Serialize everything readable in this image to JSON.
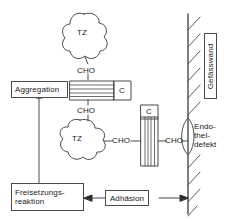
{
  "diagram": {
    "language": "de",
    "stroke_color": "#4a4a4a",
    "background": "#ffffff"
  },
  "nodes": {
    "platelet_top": {
      "label": "TZ",
      "shape": "blob",
      "x": 84,
      "y": 36
    },
    "platelet_bottom": {
      "label": "TZ",
      "shape": "blob",
      "x": 78,
      "y": 139
    },
    "cho_top": {
      "label": "CHO"
    },
    "cho_mid": {
      "label": "CHO"
    },
    "cho_left": {
      "label": "CHO"
    },
    "cho_right": {
      "label": "CHO"
    },
    "collagen_horizontal": {
      "label": "C",
      "shape": "hatched-rect-horizontal"
    },
    "collagen_vertical": {
      "label": "C",
      "shape": "hatched-rect-vertical"
    },
    "vessel_wall": {
      "label": "Gefässwand",
      "orientation": "vertical"
    },
    "endothelial_defect": {
      "lines": [
        "Endo-",
        "thel-",
        "defekt"
      ]
    }
  },
  "boxes": {
    "aggregation": {
      "label": "Aggregation"
    },
    "release_reaction": {
      "lines": [
        "Freisetzungs-",
        "reaktion"
      ]
    },
    "adhesion": {
      "label": "Adhäsion"
    }
  },
  "arrows": [
    {
      "name": "release-to-aggregation",
      "from": "release_reaction",
      "to": "aggregation",
      "direction": "up"
    },
    {
      "name": "adhesion-to-release",
      "from": "adhesion",
      "to": "release_reaction",
      "direction": "left"
    },
    {
      "name": "wall-to-adhesion",
      "from": "vessel_wall",
      "to": "adhesion",
      "direction": "right"
    }
  ]
}
